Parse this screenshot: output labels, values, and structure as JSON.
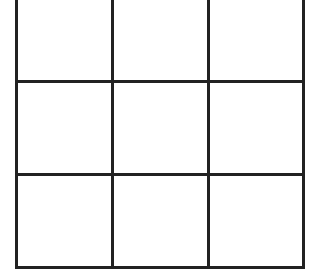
{
  "game": {
    "type": "tic-tac-toe",
    "rows": 3,
    "cols": 3,
    "line_color": "#222222",
    "background": "#ffffff",
    "cells": [
      [
        "",
        "",
        ""
      ],
      [
        "",
        "",
        ""
      ],
      [
        "",
        "",
        ""
      ]
    ]
  }
}
